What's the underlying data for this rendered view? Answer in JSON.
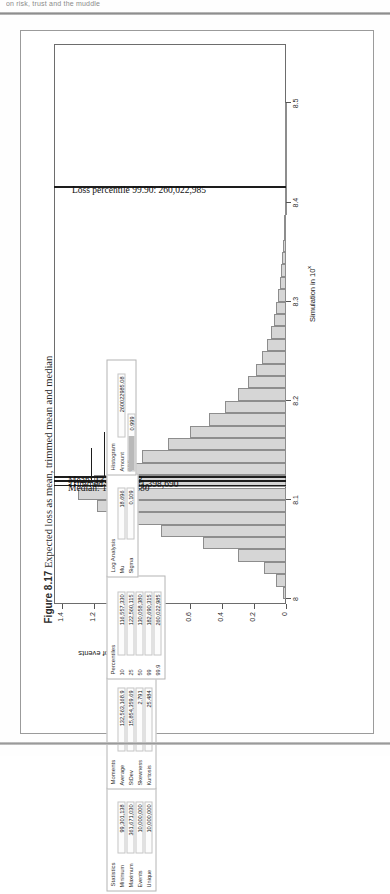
{
  "header": {
    "running_head": "on risk, trust and the muddle"
  },
  "caption": {
    "number": "Figure 8.17",
    "text": "Expected loss as mean, trimmed mean and median"
  },
  "chart_data": {
    "type": "bar",
    "title": "Expected loss as mean, trimmed mean and median",
    "xlabel": "Simulation in 10ˣ",
    "ylabel": "Thousands of events",
    "xlim": [
      7.995,
      8.56
    ],
    "ylim": [
      0,
      1.45
    ],
    "xticks": [
      "8",
      "8.1",
      "8.2",
      "8.3",
      "8.4",
      "8.5"
    ],
    "xtick_values": [
      8.0,
      8.1,
      8.2,
      8.3,
      8.4,
      8.5
    ],
    "yticks": [
      "0",
      "0.2",
      "0.4",
      "0.6",
      "0.8",
      "1",
      "1.2",
      "1.4"
    ],
    "ytick_values": [
      0,
      0.2,
      0.4,
      0.6,
      0.8,
      1.0,
      1.2,
      1.4
    ],
    "grid": false,
    "legend": "none",
    "bin_width": 0.0125,
    "x": [
      8.0063,
      8.0188,
      8.0313,
      8.0438,
      8.0563,
      8.0688,
      8.0813,
      8.0938,
      8.1063,
      8.1188,
      8.1313,
      8.1438,
      8.1563,
      8.1688,
      8.1813,
      8.1938,
      8.2063,
      8.2188,
      8.2313,
      8.2438,
      8.2563,
      8.2688,
      8.2813,
      8.2938,
      8.3063,
      8.3188,
      8.3313,
      8.3438,
      8.3563,
      8.3688,
      8.3813,
      8.3938,
      8.4063,
      8.4188,
      8.4313,
      8.4438,
      8.4563,
      8.4688,
      8.4813,
      8.4938
    ],
    "values": [
      0.02,
      0.06,
      0.14,
      0.3,
      0.52,
      0.78,
      1.0,
      1.18,
      1.3,
      1.2,
      1.06,
      0.9,
      0.74,
      0.6,
      0.48,
      0.38,
      0.3,
      0.24,
      0.19,
      0.15,
      0.12,
      0.095,
      0.075,
      0.06,
      0.048,
      0.038,
      0.03,
      0.024,
      0.019,
      0.015,
      0.012,
      0.009,
      0.007,
      0.0055,
      0.004,
      0.003,
      0.0022,
      0.0016,
      0.001,
      0.0006
    ],
    "annotations": [
      {
        "name": "median",
        "label": "Median: 130,058,380",
        "value": 8.1139
      },
      {
        "name": "trimmed-mean",
        "label": "Trimmed mean: 131,398,690",
        "value": 8.1184
      },
      {
        "name": "mean",
        "label": "Mean: 132,563,168",
        "value": 8.1223
      },
      {
        "name": "loss-percentile",
        "label": "Loss percentile 99.90: 260,022,985",
        "value": 8.415
      }
    ]
  },
  "panels": {
    "statistics": {
      "title": "Statistics",
      "rows": [
        {
          "label": "Minimum",
          "value": "99,301,138"
        },
        {
          "label": "Maximum",
          "value": "361,671,030"
        },
        {
          "label": "Events",
          "value": "10,000,000"
        },
        {
          "label": "Unique",
          "value": "10,000,000"
        }
      ]
    },
    "moments": {
      "title": "Moments",
      "rows": [
        {
          "label": "Average",
          "value": "132,563,168.9"
        },
        {
          "label": "StDev",
          "value": "15,854,359.69"
        },
        {
          "label": "Skewness",
          "value": "2.791"
        },
        {
          "label": "Kurtosis",
          "value": "25.484"
        }
      ]
    },
    "percentiles": {
      "title": "Percentiles",
      "rows": [
        {
          "label": "10",
          "value": "116,557,330"
        },
        {
          "label": "25",
          "value": "122,560,115"
        },
        {
          "label": "50",
          "value": "130,058,380"
        },
        {
          "label": "99",
          "value": "182,690,315"
        },
        {
          "label": "99.9",
          "value": "260,022,985"
        }
      ]
    },
    "log_analysis": {
      "title": "Log Analysis",
      "rows": [
        {
          "label": "Mu",
          "value": "18.696"
        },
        {
          "label": "Sigma",
          "value": "0.109"
        }
      ]
    },
    "histogram": {
      "title": "Histogram",
      "rows": [
        {
          "label": "Amount",
          "value": "260022985.08"
        },
        {
          "label": "CDF",
          "value": "0.999"
        }
      ]
    }
  }
}
